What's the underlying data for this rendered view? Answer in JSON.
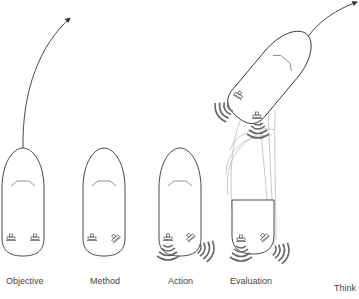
{
  "diagram": {
    "stages": [
      {
        "id": "objective",
        "label": "Objective"
      },
      {
        "id": "method",
        "label": "Method"
      },
      {
        "id": "action",
        "label": "Action"
      },
      {
        "id": "evaluation",
        "label": "Evaluation"
      },
      {
        "id": "think",
        "label": "Think"
      }
    ],
    "colors": {
      "outline": "#333333",
      "ghost": "#bbbbbb",
      "wave": "#666666",
      "label": "#444444"
    }
  }
}
